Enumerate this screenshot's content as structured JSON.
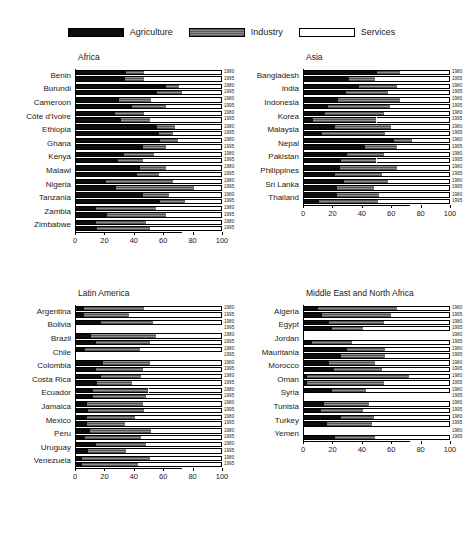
{
  "legend": {
    "items": [
      {
        "label": "Agriculture",
        "key": "agriculture",
        "color": "#0d0d0d",
        "icon": "legend-swatch-agriculture"
      },
      {
        "label": "Industry",
        "key": "industry",
        "color": "#6e6e6e",
        "icon": "legend-swatch-industry"
      },
      {
        "label": "Services",
        "key": "services",
        "color": "#ffffff",
        "icon": "legend-swatch-services"
      }
    ]
  },
  "axis": {
    "ticks": [
      0,
      20,
      40,
      60,
      80,
      100
    ],
    "tick_labels": [
      "0",
      "20",
      "40",
      "60",
      "80",
      "100"
    ],
    "min": 0,
    "max": 100
  },
  "year_labels": {
    "early": "1980",
    "late": "1995"
  },
  "chart_data": {
    "type": "bar",
    "title": "",
    "subtitle": "",
    "xlabel": "",
    "ylabel": "",
    "xlim": [
      0,
      100
    ],
    "grid": false,
    "legend_position": "top-center",
    "orientation": "horizontal",
    "stacked": true,
    "series": [
      {
        "name": "Agriculture",
        "color": "#0d0d0d"
      },
      {
        "name": "Industry",
        "color": "#6e6e6e"
      },
      {
        "name": "Services",
        "color": "#ffffff"
      }
    ],
    "years": [
      "1980",
      "1995"
    ],
    "panels": [
      {
        "title": "Africa",
        "countries": [
          {
            "name": "Benin",
            "1980": [
              35,
              12,
              53
            ],
            "1995": [
              34,
              13,
              53
            ]
          },
          {
            "name": "Burundi",
            "1980": [
              62,
              9,
              29
            ],
            "1995": [
              56,
              17,
              27
            ]
          },
          {
            "name": "Cameroon",
            "1980": [
              30,
              22,
              48
            ],
            "1995": [
              39,
              23,
              38
            ]
          },
          {
            "name": "Côte d'Ivoire",
            "1980": [
              27,
              20,
              53
            ],
            "1995": [
              31,
              20,
              49
            ]
          },
          {
            "name": "Ethiopia",
            "1980": [
              56,
              12,
              32
            ],
            "1995": [
              57,
              10,
              33
            ]
          },
          {
            "name": "Ghana",
            "1980": [
              58,
              12,
              30
            ],
            "1995": [
              46,
              16,
              38
            ]
          },
          {
            "name": "Kenya",
            "1980": [
              33,
              21,
              46
            ],
            "1995": [
              29,
              17,
              54
            ]
          },
          {
            "name": "Malawi",
            "1980": [
              44,
              18,
              38
            ],
            "1995": [
              42,
              15,
              43
            ]
          },
          {
            "name": "Nigeria",
            "1980": [
              21,
              46,
              33
            ],
            "1995": [
              28,
              53,
              19
            ]
          },
          {
            "name": "Tanzania",
            "1980": [
              46,
              18,
              36
            ],
            "1995": [
              58,
              17,
              25
            ]
          },
          {
            "name": "Zambia",
            "1980": [
              14,
              41,
              45
            ],
            "1995": [
              22,
              40,
              38
            ]
          },
          {
            "name": "Zimbabwe",
            "1980": [
              14,
              34,
              52
            ],
            "1995": [
              15,
              36,
              49
            ]
          }
        ]
      },
      {
        "title": "Asia",
        "countries": [
          {
            "name": "Bangladesh",
            "1980": [
              50,
              16,
              34
            ],
            "1995": [
              31,
              18,
              51
            ]
          },
          {
            "name": "India",
            "1980": [
              38,
              26,
              36
            ],
            "1995": [
              29,
              29,
              42
            ]
          },
          {
            "name": "Indonesia",
            "1980": [
              24,
              42,
              34
            ],
            "1995": [
              17,
              42,
              41
            ]
          },
          {
            "name": "Korea",
            "1980": [
              15,
              40,
              45
            ],
            "1995": [
              7,
              43,
              50
            ]
          },
          {
            "name": "Malaysia",
            "1980": [
              22,
              38,
              40
            ],
            "1995": [
              13,
              43,
              44
            ]
          },
          {
            "name": "Nepal",
            "1980": [
              62,
              12,
              26
            ],
            "1995": [
              42,
              22,
              36
            ]
          },
          {
            "name": "Pakistan",
            "1980": [
              30,
              25,
              45
            ],
            "1995": [
              26,
              24,
              50
            ]
          },
          {
            "name": "Philippines",
            "1980": [
              25,
              39,
              36
            ],
            "1995": [
              22,
              32,
              46
            ]
          },
          {
            "name": "Sri Lanka",
            "1980": [
              28,
              30,
              42
            ],
            "1995": [
              23,
              25,
              52
            ]
          },
          {
            "name": "Thailand",
            "1980": [
              23,
              29,
              48
            ],
            "1995": [
              11,
              40,
              49
            ]
          }
        ]
      },
      {
        "title": "Latin America",
        "countries": [
          {
            "name": "Argentina",
            "1980": [
              6,
              41,
              53
            ],
            "1995": [
              6,
              31,
              63
            ]
          },
          {
            "name": "Bolivia",
            "1980": [
              18,
              35,
              47
            ],
            "1995": null
          },
          {
            "name": "Brazil",
            "1980": [
              11,
              44,
              45
            ],
            "1995": [
              14,
              37,
              49
            ]
          },
          {
            "name": "Chile",
            "1980": [
              7,
              37,
              56
            ],
            "1995": null
          },
          {
            "name": "Colombia",
            "1980": [
              19,
              32,
              49
            ],
            "1995": [
              14,
              32,
              54
            ]
          },
          {
            "name": "Costa Rica",
            "1980": [
              18,
              27,
              55
            ],
            "1995": [
              15,
              24,
              61
            ]
          },
          {
            "name": "Ecuador",
            "1980": [
              12,
              38,
              50
            ],
            "1995": [
              12,
              36,
              52
            ]
          },
          {
            "name": "Jamaica",
            "1980": [
              8,
              38,
              54
            ],
            "1995": [
              9,
              38,
              53
            ]
          },
          {
            "name": "Mexico",
            "1980": [
              8,
              33,
              59
            ],
            "1995": [
              8,
              26,
              66
            ]
          },
          {
            "name": "Peru",
            "1980": [
              10,
              42,
              48
            ],
            "1995": [
              7,
              38,
              55
            ]
          },
          {
            "name": "Uruguay",
            "1980": [
              14,
              34,
              52
            ],
            "1995": [
              9,
              26,
              65
            ]
          },
          {
            "name": "Venezuela",
            "1980": [
              5,
              46,
              49
            ],
            "1995": [
              5,
              38,
              57
            ]
          }
        ]
      },
      {
        "title": "Middle East and North Africa",
        "countries": [
          {
            "name": "Algeria",
            "1980": [
              10,
              54,
              36
            ],
            "1995": [
              13,
              47,
              40
            ]
          },
          {
            "name": "Egypt",
            "1980": [
              18,
              37,
              45
            ],
            "1995": [
              20,
              21,
              59
            ]
          },
          {
            "name": "Jordan",
            "1980": null,
            "1995": [
              6,
              27,
              67
            ]
          },
          {
            "name": "Mauritania",
            "1980": [
              30,
              26,
              44
            ],
            "1995": [
              26,
              30,
              44
            ]
          },
          {
            "name": "Morocco",
            "1980": [
              18,
              31,
              51
            ],
            "1995": [
              21,
              33,
              46
            ]
          },
          {
            "name": "Oman",
            "1980": [
              3,
              69,
              28
            ],
            "1995": [
              3,
              52,
              45
            ]
          },
          {
            "name": "Syria",
            "1980": [
              20,
              23,
              57
            ],
            "1995": null
          },
          {
            "name": "Tunisia",
            "1980": [
              14,
              31,
              55
            ],
            "1995": [
              12,
              29,
              59
            ]
          },
          {
            "name": "Turkey",
            "1980": [
              26,
              22,
              52
            ],
            "1995": [
              16,
              31,
              53
            ]
          },
          {
            "name": "Yemen",
            "1980": null,
            "1995": [
              22,
              27,
              51
            ]
          }
        ]
      }
    ]
  }
}
